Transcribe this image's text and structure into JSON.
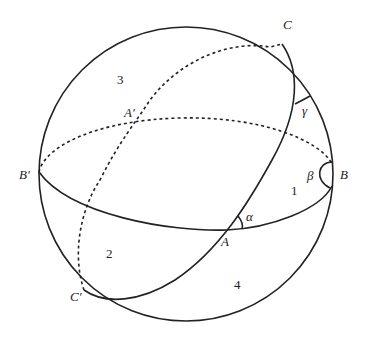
{
  "diagram": {
    "type": "spherical-triangle-lunes",
    "points": {
      "A": "A",
      "A_prime": "A′",
      "B": "B",
      "B_prime": "B′",
      "C": "C",
      "C_prime": "C′"
    },
    "angles": {
      "alpha": "α",
      "beta": "β",
      "gamma": "γ"
    },
    "regions": {
      "r1": "1",
      "r2": "2",
      "r3": "3",
      "r4": "4"
    },
    "colors": {
      "stroke": "#222222",
      "background": "#ffffff"
    }
  }
}
